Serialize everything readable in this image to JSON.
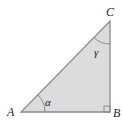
{
  "diagram": {
    "type": "right-triangle",
    "fill_color": "#dcdcdc",
    "stroke_color": "#8a8a8a",
    "vertices": {
      "A": {
        "label": "A",
        "x": 21,
        "y": 112
      },
      "B": {
        "label": "B",
        "x": 110,
        "y": 112
      },
      "C": {
        "label": "C",
        "x": 110,
        "y": 21
      }
    },
    "angles": {
      "alpha": {
        "label": "α",
        "at": "A"
      },
      "gamma": {
        "label": "γ",
        "at": "C"
      },
      "right_angle": {
        "at": "B"
      }
    }
  }
}
